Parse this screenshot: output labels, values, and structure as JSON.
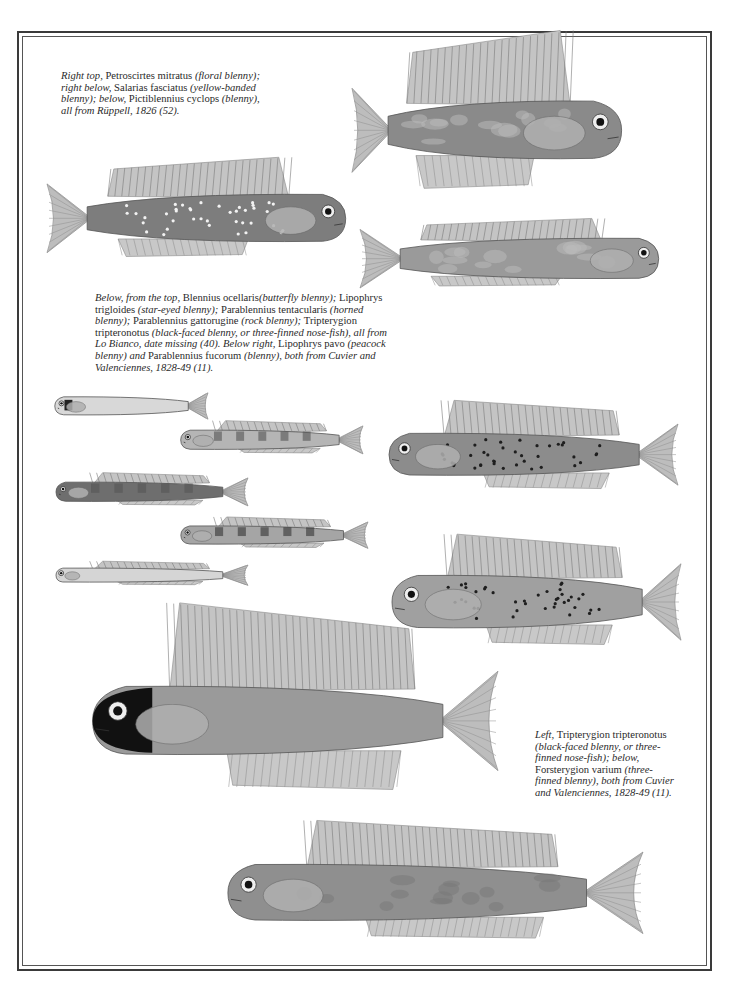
{
  "page": {
    "type": "illustrated plate",
    "palette": {
      "paper": "#ffffff",
      "ink": "#2a2a2a",
      "frame": "#3a3a3a"
    }
  },
  "captions": {
    "top": [
      {
        "t": "Right top, ",
        "i": true
      },
      {
        "t": "Petroscirtes mitratus ",
        "i": false
      },
      {
        "t": "(floral blenny); right below, ",
        "i": true
      },
      {
        "t": "Salarias fasciatus ",
        "i": false
      },
      {
        "t": "(yellow-banded blenny); below, ",
        "i": true
      },
      {
        "t": "Pictiblennius cyclops ",
        "i": false
      },
      {
        "t": "(blenny), all from Rüppell, 1826 (52).",
        "i": true
      }
    ],
    "middle": [
      {
        "t": "Below, from the top, ",
        "i": true
      },
      {
        "t": "Blennius ocellaris",
        "i": false
      },
      {
        "t": "(butterfly blenny); ",
        "i": true
      },
      {
        "t": "Lipophrys trigloides ",
        "i": false
      },
      {
        "t": "(star-eyed blenny); ",
        "i": true
      },
      {
        "t": "Parablennius tentacularis ",
        "i": false
      },
      {
        "t": "(horned blenny); ",
        "i": true
      },
      {
        "t": "Parablennius gattorugine ",
        "i": false
      },
      {
        "t": "(rock blenny); ",
        "i": true
      },
      {
        "t": "Tripterygion tripteronotus ",
        "i": false
      },
      {
        "t": "(black-faced blenny, or three-finned nose-fish), all from Lo Bianco, date missing (40). Below right, ",
        "i": true
      },
      {
        "t": "Lipophrys pavo ",
        "i": false
      },
      {
        "t": "(peacock blenny) and ",
        "i": true
      },
      {
        "t": "Parablennius fucorum ",
        "i": false
      },
      {
        "t": "(blenny), both from Cuvier and Valenciennes, 1828-49 (11).",
        "i": true
      }
    ],
    "left": [
      {
        "t": "Left, ",
        "i": true
      },
      {
        "t": "Tripterygion tripteronotus ",
        "i": false
      },
      {
        "t": "(black-faced blenny, or three-finned nose-fish); below, ",
        "i": true
      },
      {
        "t": "Forsterygion varium ",
        "i": false
      },
      {
        "t": "(three-finned blenny), both from Cuvier and Valenciennes, 1828-49 (11).",
        "i": true
      }
    ]
  },
  "illustrations": [
    {
      "id": "petroscirtes-mitratus",
      "label": "Petroscirtes mitratus",
      "pattern": "mottled",
      "tone": "#8a8a8a",
      "facing": "right"
    },
    {
      "id": "salarias-fasciatus",
      "label": "Salarias fasciatus",
      "pattern": "white-spotted",
      "tone": "#7d7d7d",
      "facing": "right"
    },
    {
      "id": "pictiblennius-cyclops",
      "label": "Pictiblennius cyclops",
      "pattern": "mottled",
      "tone": "#9a9a9a",
      "facing": "right"
    },
    {
      "id": "blennius-ocellaris",
      "label": "Blennius ocellaris",
      "pattern": "larval",
      "tone": "#d8d8d8",
      "facing": "left"
    },
    {
      "id": "lipophrys-trigloides",
      "label": "Lipophrys trigloides",
      "pattern": "banded",
      "tone": "#b5b5b5",
      "facing": "left"
    },
    {
      "id": "parablennius-tentacularis",
      "label": "Parablennius tentacularis",
      "pattern": "banded",
      "tone": "#6e6e6e",
      "facing": "left"
    },
    {
      "id": "parablennius-gattorugine",
      "label": "Parablennius gattorugine",
      "pattern": "dark-banded",
      "tone": "#a5a5a5",
      "facing": "left"
    },
    {
      "id": "tripterygion-tripteronotus-small",
      "label": "Tripterygion tripteronotus",
      "pattern": "pale",
      "tone": "#d5d5d5",
      "facing": "left"
    },
    {
      "id": "lipophrys-pavo",
      "label": "Lipophrys pavo",
      "pattern": "dark-spotted",
      "tone": "#8c8c8c",
      "facing": "left"
    },
    {
      "id": "parablennius-fucorum",
      "label": "Parablennius fucorum",
      "pattern": "dark-spotted",
      "tone": "#a0a0a0",
      "facing": "left"
    },
    {
      "id": "tripterygion-tripteronotus-large",
      "label": "Tripterygion tripteronotus",
      "pattern": "black-faced",
      "tone": "#9a9a9a",
      "facing": "left"
    },
    {
      "id": "forsterygion-varium",
      "label": "Forsterygion varium",
      "pattern": "scaled",
      "tone": "#8f8f8f",
      "facing": "left"
    }
  ]
}
